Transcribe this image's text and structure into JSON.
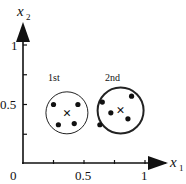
{
  "diagram": {
    "type": "cluster-scatter",
    "axes": {
      "x": {
        "label": "x",
        "subscript": "1",
        "tick_labels": [
          "0",
          "0.5",
          "1"
        ],
        "range": [
          0,
          1.05
        ]
      },
      "y": {
        "label": "x",
        "subscript": "2",
        "tick_labels": [
          "0.5",
          "1"
        ],
        "range": [
          0,
          1.05
        ]
      },
      "origin_label": "0"
    },
    "clusters": [
      {
        "name": "1st",
        "center": [
          0.36,
          0.43
        ],
        "points": [
          [
            0.25,
            0.5
          ],
          [
            0.45,
            0.5
          ],
          [
            0.29,
            0.33
          ],
          [
            0.42,
            0.34
          ]
        ],
        "circle_style": "thin"
      },
      {
        "name": "2nd",
        "center": [
          0.8,
          0.45
        ],
        "points": [
          [
            0.65,
            0.52
          ],
          [
            0.89,
            0.57
          ],
          [
            0.72,
            0.43
          ],
          [
            0.63,
            0.33
          ],
          [
            0.86,
            0.38
          ]
        ],
        "circle_style": "thick"
      }
    ],
    "centroid_marker": "×"
  }
}
